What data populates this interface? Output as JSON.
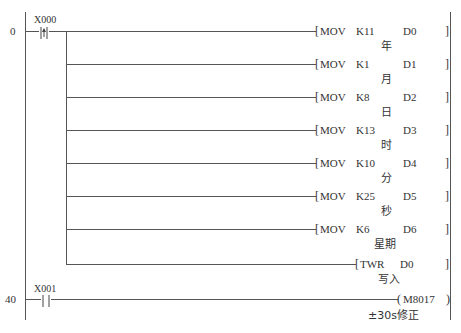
{
  "diagram": {
    "type": "ladder-logic",
    "rungs": [
      {
        "step": "0",
        "contact": {
          "label": "X000",
          "type": "rising-edge"
        },
        "instructions": [
          {
            "op": "MOV",
            "src": "K11",
            "dst": "D0",
            "comment": "年"
          },
          {
            "op": "MOV",
            "src": "K1",
            "dst": "D1",
            "comment": "月"
          },
          {
            "op": "MOV",
            "src": "K8",
            "dst": "D2",
            "comment": "日"
          },
          {
            "op": "MOV",
            "src": "K13",
            "dst": "D3",
            "comment": "时"
          },
          {
            "op": "MOV",
            "src": "K10",
            "dst": "D4",
            "comment": "分"
          },
          {
            "op": "MOV",
            "src": "K25",
            "dst": "D5",
            "comment": "秒"
          },
          {
            "op": "MOV",
            "src": "K6",
            "dst": "D6",
            "comment": "星期"
          },
          {
            "op": "TWR",
            "src": "D0",
            "dst": "",
            "comment": "写入"
          }
        ]
      },
      {
        "step": "40",
        "contact": {
          "label": "X001",
          "type": "normally-open"
        },
        "coil": {
          "label": "M8017",
          "comment": "±30s修正"
        }
      }
    ]
  }
}
